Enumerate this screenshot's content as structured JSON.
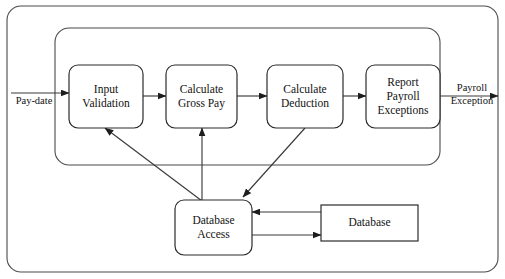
{
  "diagram": {
    "type": "data-flow-diagram",
    "colors": {
      "background": "#ffffff",
      "frame_stroke": "#4a4a4a",
      "box_stroke": "#2b2b2b",
      "line_stroke": "#3a3a3a",
      "text": "#111111"
    },
    "frames": [
      {
        "name": "outer-boundary",
        "x": 7,
        "y": 6,
        "width": 491,
        "height": 266,
        "rx": 14
      },
      {
        "name": "inner-boundary",
        "x": 55,
        "y": 28,
        "width": 385,
        "height": 137,
        "rx": 14
      }
    ],
    "processes": [
      {
        "id": "input-validation",
        "lines": [
          "Input",
          "Validation"
        ],
        "x": 69,
        "y": 65,
        "width": 74,
        "height": 63,
        "rx": 9
      },
      {
        "id": "calculate-gross-pay",
        "lines": [
          "Calculate",
          "Gross Pay"
        ],
        "x": 166,
        "y": 65,
        "width": 71,
        "height": 63,
        "rx": 9
      },
      {
        "id": "calculate-deduction",
        "lines": [
          "Calculate",
          "Deduction"
        ],
        "x": 267,
        "y": 65,
        "width": 76,
        "height": 63,
        "rx": 9
      },
      {
        "id": "report-payroll-exceptions",
        "lines": [
          "Report",
          "Payroll",
          "Exceptions"
        ],
        "x": 366,
        "y": 65,
        "width": 74,
        "height": 63,
        "rx": 9
      },
      {
        "id": "database-access",
        "lines": [
          "Database",
          "Access"
        ],
        "x": 175,
        "y": 200,
        "width": 77,
        "height": 55,
        "rx": 9
      }
    ],
    "stores": [
      {
        "id": "database",
        "lines": [
          "Database"
        ],
        "x": 321,
        "y": 205,
        "width": 97,
        "height": 36
      }
    ],
    "edge_labels": [
      {
        "id": "pay-date",
        "lines": [
          "Pay-date"
        ],
        "x": 34,
        "y": 102
      },
      {
        "id": "payroll-exception",
        "lines": [
          "Payroll",
          "Exception"
        ],
        "x": 472,
        "y": 95
      }
    ],
    "flows": [
      {
        "id": "flow-paydate-to-input-validation",
        "points": "11,93 69,93",
        "arrow": "end"
      },
      {
        "id": "flow-input-validation-to-gross-pay",
        "points": "143,96 166,96",
        "arrow": "end"
      },
      {
        "id": "flow-gross-pay-to-deduction",
        "points": "237,96 267,96",
        "arrow": "end"
      },
      {
        "id": "flow-deduction-to-report",
        "points": "343,96 366,96",
        "arrow": "end"
      },
      {
        "id": "flow-report-to-payroll-exception",
        "points": "440,96 498,96",
        "arrow": "end"
      },
      {
        "id": "flow-database-access-to-input-validation",
        "points": "214,210 105,128",
        "arrow": "end"
      },
      {
        "id": "flow-database-access-to-gross-pay",
        "points": "202,200 202,128",
        "arrow": "end"
      },
      {
        "id": "flow-deduction-to-database-access",
        "points": "305,128 243,197",
        "arrow": "end"
      },
      {
        "id": "flow-database-to-database-access",
        "points": "321,212 252,212",
        "arrow": "end"
      },
      {
        "id": "flow-database-access-to-database",
        "points": "252,235 321,235",
        "arrow": "end"
      }
    ]
  }
}
